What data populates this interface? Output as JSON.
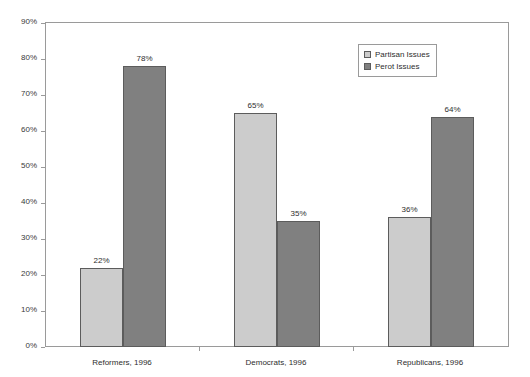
{
  "chart_data": {
    "type": "bar",
    "title": "",
    "subtitle": "",
    "xlabel": "",
    "ylabel": "",
    "ylim": [
      0,
      90
    ],
    "y_tick_labels": [
      "0%",
      "10%",
      "20%",
      "30%",
      "40%",
      "50%",
      "60%",
      "70%",
      "80%",
      "90%"
    ],
    "y_tick_values": [
      0,
      10,
      20,
      30,
      40,
      50,
      60,
      70,
      80,
      90
    ],
    "grid": false,
    "legend_position": "top-right",
    "categories": [
      "Reformers, 1996",
      "Democrats, 1996",
      "Republicans, 1996"
    ],
    "series": [
      {
        "name": "Partisan Issues",
        "color": "#cccccc",
        "values": [
          22,
          65,
          36
        ],
        "value_labels": [
          "22%",
          "65%",
          "36%"
        ]
      },
      {
        "name": "Perot Issues",
        "color": "#808080",
        "values": [
          78,
          35,
          64
        ],
        "value_labels": [
          "78%",
          "35%",
          "64%"
        ]
      }
    ]
  },
  "legend": {
    "items": [
      {
        "label": "Partisan Issues",
        "color": "#cccccc"
      },
      {
        "label": "Perot Issues",
        "color": "#808080"
      }
    ]
  },
  "colors": {
    "series_light": "#cccccc",
    "series_dark": "#808080",
    "bar_outline": "#5c5c5c",
    "axis": "#9a9a9a",
    "text": "#2e2e2e",
    "background": "#ffffff"
  }
}
